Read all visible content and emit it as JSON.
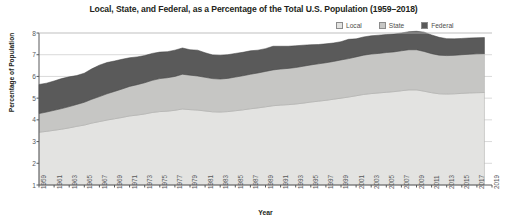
{
  "chart_data": {
    "type": "area",
    "title": "Local, State, and Federal, as a Percentage of the Total U.S. Population (1959–2018)",
    "xlabel": "Year",
    "ylabel": "Percentage of Population",
    "ylim": [
      1,
      8
    ],
    "xlim": [
      1959,
      2019
    ],
    "grid": true,
    "stacked": true,
    "legend_position": "top-right",
    "y_ticks": [
      1,
      2,
      3,
      4,
      5,
      6,
      7,
      8
    ],
    "x_ticks": [
      1959,
      1961,
      1963,
      1965,
      1967,
      1969,
      1971,
      1973,
      1975,
      1977,
      1979,
      1981,
      1983,
      1985,
      1987,
      1989,
      1991,
      1993,
      1995,
      1997,
      1999,
      2001,
      2003,
      2005,
      2007,
      2009,
      2011,
      2013,
      2015,
      2017,
      2019
    ],
    "x": [
      1959,
      1960,
      1961,
      1962,
      1963,
      1964,
      1965,
      1966,
      1967,
      1968,
      1969,
      1970,
      1971,
      1972,
      1973,
      1974,
      1975,
      1976,
      1977,
      1978,
      1979,
      1980,
      1981,
      1982,
      1983,
      1984,
      1985,
      1986,
      1987,
      1988,
      1989,
      1990,
      1991,
      1992,
      1993,
      1994,
      1995,
      1996,
      1997,
      1998,
      1999,
      2000,
      2001,
      2002,
      2003,
      2004,
      2005,
      2006,
      2007,
      2008,
      2009,
      2010,
      2011,
      2012,
      2013,
      2014,
      2015,
      2016,
      2017,
      2018
    ],
    "series": [
      {
        "name": "Local",
        "color": "#e3e3e1",
        "values": [
          2.43,
          2.47,
          2.52,
          2.57,
          2.63,
          2.7,
          2.76,
          2.85,
          2.92,
          2.99,
          3.05,
          3.11,
          3.18,
          3.22,
          3.27,
          3.34,
          3.38,
          3.4,
          3.44,
          3.5,
          3.47,
          3.45,
          3.41,
          3.37,
          3.36,
          3.38,
          3.42,
          3.46,
          3.51,
          3.55,
          3.6,
          3.65,
          3.68,
          3.7,
          3.73,
          3.77,
          3.82,
          3.86,
          3.9,
          3.95,
          4.0,
          4.05,
          4.11,
          4.17,
          4.21,
          4.24,
          4.27,
          4.3,
          4.34,
          4.38,
          4.38,
          4.32,
          4.25,
          4.2,
          4.19,
          4.2,
          4.22,
          4.24,
          4.25,
          4.26
        ]
      },
      {
        "name": "State",
        "color": "#c6c6c4",
        "values": [
          0.86,
          0.89,
          0.92,
          0.95,
          0.98,
          1.01,
          1.05,
          1.1,
          1.15,
          1.21,
          1.26,
          1.31,
          1.36,
          1.4,
          1.44,
          1.48,
          1.52,
          1.54,
          1.56,
          1.6,
          1.59,
          1.57,
          1.55,
          1.53,
          1.52,
          1.53,
          1.55,
          1.57,
          1.59,
          1.61,
          1.63,
          1.65,
          1.66,
          1.67,
          1.68,
          1.7,
          1.71,
          1.72,
          1.73,
          1.74,
          1.76,
          1.77,
          1.79,
          1.81,
          1.82,
          1.82,
          1.83,
          1.83,
          1.84,
          1.85,
          1.85,
          1.83,
          1.8,
          1.78,
          1.77,
          1.77,
          1.78,
          1.78,
          1.79,
          1.79
        ]
      },
      {
        "name": "Federal",
        "color": "#5a5a5a",
        "values": [
          1.34,
          1.33,
          1.35,
          1.38,
          1.37,
          1.33,
          1.34,
          1.4,
          1.45,
          1.44,
          1.4,
          1.37,
          1.32,
          1.28,
          1.25,
          1.24,
          1.22,
          1.2,
          1.21,
          1.21,
          1.17,
          1.19,
          1.13,
          1.09,
          1.09,
          1.09,
          1.09,
          1.08,
          1.08,
          1.05,
          1.05,
          1.09,
          1.05,
          1.02,
          1.0,
          0.97,
          0.93,
          0.89,
          0.87,
          0.85,
          0.84,
          0.89,
          0.83,
          0.84,
          0.84,
          0.84,
          0.83,
          0.82,
          0.82,
          0.83,
          0.85,
          0.89,
          0.86,
          0.82,
          0.78,
          0.76,
          0.75,
          0.75,
          0.74,
          0.74
        ]
      }
    ]
  },
  "legend": {
    "items": [
      {
        "label": "Local",
        "color": "#e3e3e1"
      },
      {
        "label": "State",
        "color": "#c6c6c4"
      },
      {
        "label": "Federal",
        "color": "#5a5a5a"
      }
    ]
  }
}
